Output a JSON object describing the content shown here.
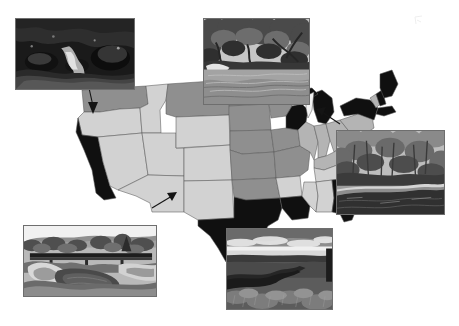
{
  "figure": {
    "width": 459,
    "height": 326,
    "background_color": "#ffffff"
  },
  "map": {
    "name": "contiguous-united-states",
    "projection": "albers-equal-area",
    "border_color": "#5a5a5a",
    "shade_legend": [
      {
        "key": "black",
        "color": "#101010",
        "label": "Class 1"
      },
      {
        "key": "dark_gray",
        "color": "#8f8f8f",
        "label": "Class 2"
      },
      {
        "key": "mid_gray",
        "color": "#b4b4b4",
        "label": "Class 3"
      },
      {
        "key": "light_gray",
        "color": "#d2d2d2",
        "label": "Class 4"
      },
      {
        "key": "white",
        "color": "#f2f2f2",
        "label": "Class 5"
      }
    ],
    "regions": [
      {
        "name": "washington",
        "shade": "dark_gray"
      },
      {
        "name": "oregon",
        "shade": "light_gray"
      },
      {
        "name": "california",
        "shade": "black"
      },
      {
        "name": "idaho",
        "shade": "light_gray"
      },
      {
        "name": "nevada",
        "shade": "light_gray"
      },
      {
        "name": "utah",
        "shade": "light_gray"
      },
      {
        "name": "arizona",
        "shade": "light_gray"
      },
      {
        "name": "montana",
        "shade": "dark_gray"
      },
      {
        "name": "wyoming",
        "shade": "light_gray"
      },
      {
        "name": "colorado",
        "shade": "light_gray"
      },
      {
        "name": "new-mexico",
        "shade": "light_gray"
      },
      {
        "name": "north-dakota",
        "shade": "dark_gray"
      },
      {
        "name": "south-dakota",
        "shade": "dark_gray"
      },
      {
        "name": "nebraska",
        "shade": "dark_gray"
      },
      {
        "name": "kansas",
        "shade": "dark_gray"
      },
      {
        "name": "oklahoma",
        "shade": "dark_gray"
      },
      {
        "name": "texas",
        "shade": "black"
      },
      {
        "name": "minnesota",
        "shade": "dark_gray"
      },
      {
        "name": "iowa",
        "shade": "dark_gray"
      },
      {
        "name": "missouri",
        "shade": "dark_gray"
      },
      {
        "name": "arkansas",
        "shade": "light_gray"
      },
      {
        "name": "louisiana",
        "shade": "black"
      },
      {
        "name": "wisconsin",
        "shade": "black"
      },
      {
        "name": "illinois",
        "shade": "mid_gray"
      },
      {
        "name": "michigan",
        "shade": "black"
      },
      {
        "name": "indiana",
        "shade": "mid_gray"
      },
      {
        "name": "ohio",
        "shade": "mid_gray"
      },
      {
        "name": "kentucky",
        "shade": "mid_gray"
      },
      {
        "name": "tennessee",
        "shade": "light_gray"
      },
      {
        "name": "mississippi",
        "shade": "light_gray"
      },
      {
        "name": "alabama",
        "shade": "light_gray"
      },
      {
        "name": "georgia",
        "shade": "black"
      },
      {
        "name": "florida",
        "shade": "black"
      },
      {
        "name": "south-carolina",
        "shade": "black"
      },
      {
        "name": "north-carolina",
        "shade": "black"
      },
      {
        "name": "virginia",
        "shade": "black"
      },
      {
        "name": "west-virginia",
        "shade": "mid_gray"
      },
      {
        "name": "pennsylvania",
        "shade": "mid_gray"
      },
      {
        "name": "new-york",
        "shade": "black"
      },
      {
        "name": "maine",
        "shade": "black"
      },
      {
        "name": "vermont",
        "shade": "mid_gray"
      },
      {
        "name": "new-hampshire",
        "shade": "black"
      },
      {
        "name": "massachusetts",
        "shade": "black"
      },
      {
        "name": "maryland",
        "shade": "black"
      },
      {
        "name": "great-lakes",
        "shade": "white"
      }
    ]
  },
  "photos": [
    {
      "id": "photo-pacific-northwest",
      "caption": "Dark forested boulder stream",
      "position": "top-left",
      "x": 15,
      "y": 18,
      "w": 120,
      "h": 72,
      "scene": "forest-boulder-stream",
      "tone": "dark",
      "points_to": "pacific-northwest"
    },
    {
      "id": "photo-southeast-river",
      "caption": "Slow river beneath overhanging hardwood canopy",
      "position": "top-center",
      "x": 203,
      "y": 18,
      "w": 107,
      "h": 87,
      "scene": "canopy-river",
      "tone": "mid",
      "points_to": "upper-midwest"
    },
    {
      "id": "photo-appalachian-stream",
      "caption": "Wooded stream with fallen log",
      "position": "right",
      "x": 336,
      "y": 130,
      "w": 109,
      "h": 85,
      "scene": "wooded-stream-log",
      "tone": "mid",
      "points_to": "northeast"
    },
    {
      "id": "photo-plains-bridge",
      "caption": "Bridge crossing a prairie stream",
      "position": "bottom-left",
      "x": 23,
      "y": 225,
      "w": 134,
      "h": 72,
      "scene": "bridge-over-stream",
      "tone": "light",
      "points_to": "southwest"
    },
    {
      "id": "photo-grassland-channel",
      "caption": "Grassland channel under open sky",
      "position": "bottom-center",
      "x": 226,
      "y": 228,
      "w": 107,
      "h": 82,
      "scene": "grassland-channel",
      "tone": "mid",
      "points_to": "south-central"
    }
  ],
  "leaders": [
    {
      "id": "leader-northwest",
      "from_photo": "photo-pacific-northwest",
      "to_region": "washington",
      "head": "down"
    },
    {
      "id": "leader-southwest",
      "from_photo": "photo-plains-bridge",
      "to_region": "new-mexico",
      "head": "up-right"
    },
    {
      "id": "leader-northeast",
      "from_photo": "photo-appalachian-stream",
      "to_region": "new-york",
      "head": "up-left"
    }
  ]
}
